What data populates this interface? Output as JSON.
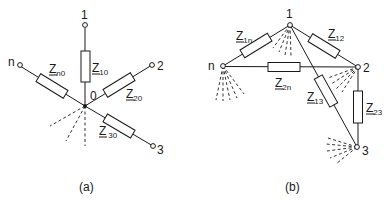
{
  "figure": {
    "panel_a": {
      "caption": "(a)",
      "center_node": "0",
      "nodes": {
        "n1": "1",
        "n2": "2",
        "n3": "3",
        "nn": "n"
      },
      "impedances": {
        "z10": {
          "main": "Z",
          "sub": "10"
        },
        "z20": {
          "main": "Z",
          "sub": "20"
        },
        "z30": {
          "main": "Z",
          "sub": "30"
        },
        "zn0": {
          "main": "Z",
          "sub": "n0"
        }
      }
    },
    "panel_b": {
      "caption": "(b)",
      "nodes": {
        "n1": "1",
        "n2": "2",
        "n3": "3",
        "nn": "n"
      },
      "impedances": {
        "z1n": {
          "main": "Z",
          "sub": "1n"
        },
        "z12": {
          "main": "Z",
          "sub": "12"
        },
        "z2n": {
          "main": "Z",
          "sub": "2n"
        },
        "z13": {
          "main": "Z",
          "sub": "13"
        },
        "z23": {
          "main": "Z",
          "sub": "23"
        }
      }
    }
  }
}
